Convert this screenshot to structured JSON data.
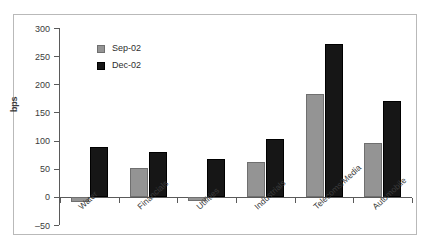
{
  "chart_data": {
    "type": "bar",
    "title": "",
    "subtitle": "",
    "xlabel": "",
    "ylabel": "bps",
    "ylim": [
      -50,
      300
    ],
    "yticks": [
      -50,
      0,
      50,
      100,
      150,
      200,
      250,
      300
    ],
    "ytick_labels": [
      "–50",
      "0",
      "50",
      "100",
      "150",
      "200",
      "250",
      "300"
    ],
    "grid": false,
    "legend_position": "upper-left-inside",
    "categories": [
      "Water",
      "Financials",
      "Utilities",
      "Industrials",
      "Telecoms/Media",
      "Automobile"
    ],
    "series": [
      {
        "name": "Sep-02",
        "color": "#949494",
        "values": [
          -10,
          52,
          -8,
          62,
          182,
          96
        ]
      },
      {
        "name": "Dec-02",
        "color": "#161616",
        "values": [
          88,
          80,
          67,
          103,
          272,
          171
        ]
      }
    ]
  },
  "legend": {
    "items": [
      {
        "label": "Sep-02"
      },
      {
        "label": "Dec-02"
      }
    ]
  },
  "axis": {
    "y_title": "bps"
  }
}
